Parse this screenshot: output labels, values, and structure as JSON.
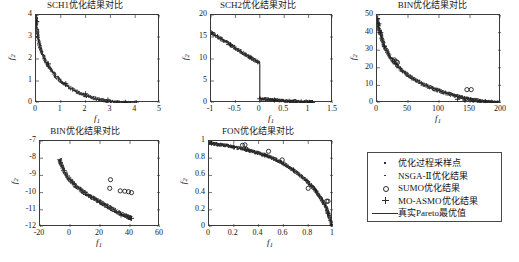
{
  "figure": {
    "background": "#ffffff",
    "width": 519,
    "height": 262
  },
  "legend": {
    "name": "plot-legend",
    "entries": [
      {
        "marker": "dot-small-icon",
        "label": "优化过程采样点"
      },
      {
        "marker": "dot-small-icon",
        "label": "NSGA-Ⅱ优化结果"
      },
      {
        "marker": "circle-icon",
        "label": "SUMO优化结果"
      },
      {
        "marker": "plus-icon",
        "label": "MO-ASMO优化结果"
      },
      {
        "marker": "line-icon",
        "label": "真实Pareto最优值"
      }
    ]
  },
  "chart_data": [
    {
      "id": "sch1",
      "type": "scatter",
      "title": "SCH1优化结果对比",
      "xlabel": "f1",
      "ylabel": "f2",
      "xlim": [
        0,
        5
      ],
      "ylim": [
        0,
        4
      ],
      "xticks": [
        0,
        1,
        2,
        3,
        4,
        5
      ],
      "xticklabels": [
        "0",
        "1",
        "2",
        "3",
        "4",
        "5"
      ],
      "yticks": [
        0,
        1,
        2,
        3,
        4
      ],
      "yticklabels": [
        "0",
        "1",
        "2",
        "3",
        "4"
      ],
      "grid": false,
      "pareto_curve": {
        "description": "真实Pareto最优值 - convex decreasing front f2 = (2 - sqrt(f1))^2",
        "x": [
          0.0,
          0.04,
          0.09,
          0.16,
          0.25,
          0.36,
          0.49,
          0.64,
          0.81,
          1.0,
          1.21,
          1.44,
          1.69,
          1.96,
          2.25,
          2.56,
          2.89,
          3.24,
          3.61,
          4.0
        ],
        "y": [
          4.0,
          2.89,
          2.25,
          1.96,
          1.44,
          1.0,
          0.81,
          0.64,
          0.49,
          1.0,
          0.36,
          0.25,
          0.16,
          0.09,
          0.04,
          0.0,
          0.0,
          0.0,
          0.0,
          0.0
        ]
      },
      "series": [
        {
          "name": "优化过程采样点",
          "marker": "dot",
          "x": [
            0.02,
            0.05,
            0.09,
            0.14,
            0.2,
            0.3,
            0.42,
            0.55,
            0.7,
            0.88,
            1.1,
            1.3,
            1.55,
            1.8,
            2.1,
            2.4,
            2.7,
            3.0,
            3.3,
            3.6,
            3.9,
            4.05
          ],
          "y": [
            3.72,
            3.42,
            3.12,
            2.85,
            2.6,
            2.25,
            1.92,
            1.65,
            1.4,
            1.18,
            0.95,
            0.8,
            0.64,
            0.5,
            0.37,
            0.26,
            0.18,
            0.11,
            0.06,
            0.03,
            0.01,
            0.0
          ]
        },
        {
          "name": "MO-ASMO优化结果",
          "marker": "plus",
          "x": [
            0.03,
            0.5,
            1.2,
            2.0,
            2.9,
            3.6,
            4.05
          ],
          "y": [
            3.7,
            1.78,
            0.88,
            0.42,
            0.14,
            0.03,
            0.0
          ]
        }
      ]
    },
    {
      "id": "sch2",
      "type": "scatter",
      "title": "SCH2优化结果对比",
      "xlabel": "f1",
      "ylabel": "f2",
      "xlim": [
        -1,
        1.5
      ],
      "ylim": [
        0,
        20
      ],
      "xticks": [
        -1,
        -0.5,
        0,
        0.5,
        1,
        1.5
      ],
      "xticklabels": [
        "-1",
        "-0.5",
        "0",
        "0.5",
        "1",
        "1.5"
      ],
      "yticks": [
        0,
        5,
        10,
        15,
        20
      ],
      "yticklabels": [
        "0",
        "5",
        "10",
        "15",
        "20"
      ],
      "grid": false,
      "pareto_curve": {
        "description": "Two disjoint branches: upper segment from (-1,16) to (0,9), then drop to (0,1) and tail to (1.05,0.1)",
        "branch_a_x": [
          -1.0,
          -0.8,
          -0.6,
          -0.4,
          -0.2,
          0.0
        ],
        "branch_a_y": [
          16.0,
          14.6,
          13.2,
          11.8,
          10.4,
          9.0
        ],
        "branch_b_x": [
          0.0,
          0.1,
          0.2,
          0.3,
          0.4,
          0.5,
          0.6,
          0.7,
          0.8,
          0.9,
          1.0,
          1.08
        ],
        "branch_b_y": [
          1.0,
          0.9,
          0.8,
          0.7,
          0.6,
          0.5,
          0.42,
          0.34,
          0.28,
          0.22,
          0.16,
          0.1
        ]
      },
      "series": [
        {
          "name": "MO-ASMO优化结果",
          "marker": "plus",
          "x": [
            -1.0,
            -0.6,
            -0.2,
            0.0,
            0.3,
            0.6,
            0.85,
            1.02,
            1.08
          ],
          "y": [
            16.0,
            13.2,
            10.4,
            0.95,
            0.68,
            0.4,
            0.25,
            0.14,
            0.1
          ]
        },
        {
          "name": "SUMO优化结果",
          "marker": "circle",
          "x": [
            0.72,
            0.95,
            1.05
          ],
          "y": [
            0.35,
            0.2,
            0.12
          ]
        }
      ]
    },
    {
      "id": "bin_top",
      "type": "scatter",
      "title": "BIN优化结果对比",
      "xlabel": "f1",
      "ylabel": "f2",
      "xlim": [
        0,
        200
      ],
      "ylim": [
        0,
        50
      ],
      "xticks": [
        0,
        50,
        100,
        150,
        200
      ],
      "xticklabels": [
        "0",
        "50",
        "100",
        "150",
        "200"
      ],
      "yticks": [
        0,
        10,
        20,
        30,
        40,
        50
      ],
      "yticklabels": [
        "0",
        "10",
        "20",
        "30",
        "40",
        "50"
      ],
      "grid": false,
      "pareto_curve": {
        "description": "Steeply decaying convex front from (0,48) to (195,0)",
        "x": [
          0,
          2,
          5,
          10,
          18,
          28,
          40,
          55,
          72,
          90,
          110,
          130,
          150,
          170,
          195
        ],
        "y": [
          48,
          44,
          40,
          34,
          28,
          23,
          18.5,
          14.5,
          11,
          8.2,
          5.8,
          3.8,
          2.1,
          0.9,
          0.1
        ]
      },
      "series": [
        {
          "name": "MO-ASMO优化结果",
          "marker": "plus",
          "x": [
            1,
            3,
            6,
            12,
            130,
            142,
            155,
            165,
            175,
            185,
            195
          ],
          "y": [
            48,
            45,
            40,
            32,
            2.1,
            1.5,
            1.1,
            0.8,
            0.6,
            0.4,
            0.2
          ]
        },
        {
          "name": "SUMO优化结果",
          "marker": "circle",
          "x": [
            28,
            31,
            33,
            145,
            152
          ],
          "y": [
            24.5,
            23.5,
            23.0,
            7.6,
            7.6
          ]
        }
      ]
    },
    {
      "id": "bin_bottom",
      "type": "scatter",
      "title": "BIN优化结果对比",
      "xlabel": "f1",
      "ylabel": "f2",
      "xlim": [
        -20,
        60
      ],
      "ylim": [
        -12,
        -7
      ],
      "xticks": [
        -20,
        0,
        20,
        40,
        60
      ],
      "xticklabels": [
        "-20",
        "0",
        "20",
        "40",
        "60"
      ],
      "yticks": [
        -12,
        -11,
        -10,
        -9,
        -8,
        -7
      ],
      "yticklabels": [
        "-12",
        "-11",
        "-10",
        "-9",
        "-8",
        "-7"
      ],
      "grid": false,
      "pareto_curve": {
        "description": "Concave band descending from (-7,-8.05) to (41,-11.5)",
        "x": [
          -7,
          -6,
          -4,
          -1,
          3,
          8,
          13,
          18,
          23,
          28,
          32,
          36,
          39,
          41
        ],
        "y": [
          -8.05,
          -8.35,
          -8.75,
          -9.15,
          -9.55,
          -9.9,
          -10.2,
          -10.45,
          -10.7,
          -10.95,
          -11.15,
          -11.3,
          -11.42,
          -11.5
        ]
      },
      "series": [
        {
          "name": "SUMO优化结果",
          "marker": "circle",
          "x": [
            27,
            26.5,
            33.5,
            36.5,
            39,
            41
          ],
          "y": [
            -9.25,
            -9.75,
            -9.9,
            -9.92,
            -9.95,
            -10.0
          ]
        },
        {
          "name": "MO-ASMO优化结果",
          "marker": "plus",
          "x": [
            34,
            41
          ],
          "y": [
            -11.3,
            -11.5
          ]
        }
      ]
    },
    {
      "id": "fon",
      "type": "scatter",
      "title": "FON优化结果对比",
      "xlabel": "f1",
      "ylabel": "f2",
      "xlim": [
        0,
        1
      ],
      "ylim": [
        0,
        1
      ],
      "xticks": [
        0,
        0.2,
        0.4,
        0.6,
        0.8,
        1
      ],
      "xticklabels": [
        "0",
        "0.2",
        "0.4",
        "0.6",
        "0.8",
        "1"
      ],
      "yticks": [
        0,
        0.2,
        0.4,
        0.6,
        0.8,
        1
      ],
      "yticklabels": [
        "0",
        "0.2",
        "0.4",
        "0.6",
        "0.8",
        "1"
      ],
      "grid": false,
      "pareto_curve": {
        "description": "Concave Fonseca front from (0,0.98) down to (0.99,0.02)",
        "x": [
          0.0,
          0.05,
          0.1,
          0.15,
          0.2,
          0.3,
          0.4,
          0.5,
          0.6,
          0.7,
          0.78,
          0.85,
          0.9,
          0.94,
          0.97,
          0.99
        ],
        "y": [
          0.98,
          0.965,
          0.955,
          0.945,
          0.93,
          0.9,
          0.86,
          0.81,
          0.74,
          0.64,
          0.55,
          0.44,
          0.34,
          0.24,
          0.12,
          0.02
        ]
      },
      "series": [
        {
          "name": "SUMO优化结果",
          "marker": "circle",
          "x": [
            0.27,
            0.29,
            0.3,
            0.48,
            0.59,
            0.8,
            0.95,
            0.96
          ],
          "y": [
            0.95,
            0.955,
            0.905,
            0.88,
            0.78,
            0.45,
            0.3,
            0.3
          ]
        },
        {
          "name": "MO-ASMO优化结果",
          "marker": "plus",
          "x": [
            0.02,
            0.2,
            0.45,
            0.68,
            0.86,
            0.96,
            0.99
          ],
          "y": [
            0.975,
            0.93,
            0.835,
            0.665,
            0.42,
            0.16,
            0.02
          ]
        }
      ]
    }
  ]
}
